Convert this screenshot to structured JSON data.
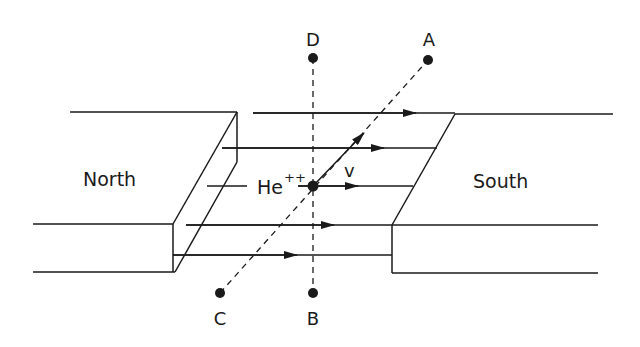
{
  "diagram": {
    "labels": {
      "north": "North",
      "south": "South",
      "particle": "He",
      "charge": "++",
      "velocity": "v",
      "point_a": "A",
      "point_b": "B",
      "point_c": "C",
      "point_d": "D"
    },
    "colors": {
      "line": "#1a1a1a",
      "background": "#ffffff"
    }
  }
}
